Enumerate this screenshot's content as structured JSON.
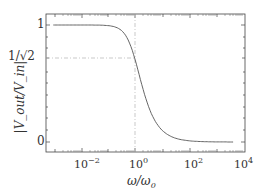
{
  "chart_data": {
    "type": "line",
    "title": "",
    "xlabel": "ω/ω0",
    "ylabel": "|Vout/Vin|",
    "xscale": "log",
    "xlim": [
      0.0005,
      10000
    ],
    "ylim": [
      -0.08,
      1.1
    ],
    "x_ticks": [
      "10^-2",
      "10^0",
      "10^2",
      "10^4"
    ],
    "y_ticks": [
      "0",
      "1/√2",
      "1"
    ],
    "grid": false,
    "legend": null,
    "series": [
      {
        "name": "first-order low-pass magnitude",
        "x": [
          0.001,
          0.01,
          0.1,
          0.3,
          1,
          3,
          10,
          100,
          1000,
          5000
        ],
        "values": [
          1.0,
          1.0,
          0.995,
          0.958,
          0.707,
          0.316,
          0.1,
          0.01,
          0.001,
          0.0002
        ]
      }
    ],
    "annotations": [
      {
        "type": "dash-dot hline",
        "y": 0.707,
        "label": "1/√2"
      },
      {
        "type": "dash-dot vline",
        "x": 1
      }
    ]
  },
  "labels": {
    "y_tick_1": "1",
    "y_tick_half": "1/√2",
    "y_tick_0": "0",
    "x_tick_m2": "10",
    "x_tick_m2_exp": "−2",
    "x_tick_0": "10",
    "x_tick_0_exp": "0",
    "x_tick_2": "10",
    "x_tick_2_exp": "2",
    "x_tick_4": "10",
    "x_tick_4_exp": "4",
    "xlabel_main": "ω/ω",
    "xlabel_sub": "0",
    "ylabel": "|V_out/V_in|"
  },
  "colors": {
    "frame": "#444444",
    "curve": "#555555",
    "guide": "#bbbbbb"
  }
}
